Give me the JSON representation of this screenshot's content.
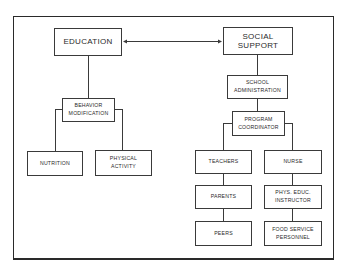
{
  "diagram": {
    "nodes": {
      "education": "EDUCATION",
      "social_support": "SOCIAL\nSUPPORT",
      "behavior_modification": "BEHAVIOR\nMODIFICATION",
      "nutrition": "NUTRITION",
      "physical_activity": "PHYSICAL\nACTIVITY",
      "school_administration": "SCHOOL\nADMINISTRATION",
      "program_coordinator": "PROGRAM\nCOORDINATOR",
      "teachers": "TEACHERS",
      "nurse": "NURSE",
      "parents": "PARENTS",
      "phys_educ_instructor": "PHYS. EDUC.\nINSTRUCTOR",
      "peers": "PEERS",
      "food_service_personnel": "FOOD SERVICE\nPERSONNEL"
    },
    "edges": [
      {
        "from": "education",
        "to": "social_support",
        "type": "bidirectional-arrow"
      },
      {
        "from": "education",
        "to": "behavior_modification"
      },
      {
        "from": "behavior_modification",
        "to": "nutrition"
      },
      {
        "from": "behavior_modification",
        "to": "physical_activity"
      },
      {
        "from": "social_support",
        "to": "school_administration"
      },
      {
        "from": "school_administration",
        "to": "program_coordinator"
      },
      {
        "from": "program_coordinator",
        "to": "teachers"
      },
      {
        "from": "program_coordinator",
        "to": "nurse"
      },
      {
        "from": "teachers",
        "to": "parents"
      },
      {
        "from": "parents",
        "to": "peers"
      },
      {
        "from": "nurse",
        "to": "phys_educ_instructor"
      },
      {
        "from": "phys_educ_instructor",
        "to": "food_service_personnel"
      }
    ]
  }
}
